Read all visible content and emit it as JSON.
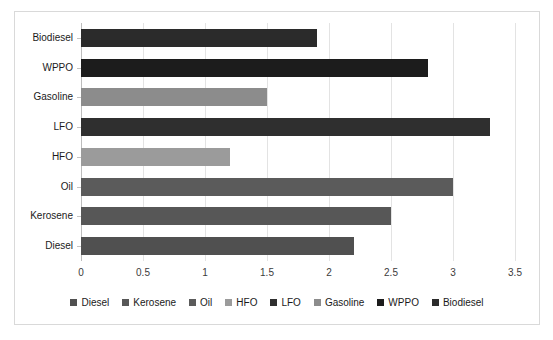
{
  "chart_data": {
    "type": "bar",
    "orientation": "horizontal",
    "title": "",
    "xlabel": "",
    "ylabel": "",
    "xlim": [
      0,
      3.5
    ],
    "xticks": [
      "0",
      "0.5",
      "1",
      "1.5",
      "2",
      "2.5",
      "3",
      "3.5"
    ],
    "xtick_values": [
      0,
      0.5,
      1,
      1.5,
      2,
      2.5,
      3,
      3.5
    ],
    "grid": true,
    "legend_position": "bottom",
    "categories": [
      "Biodiesel",
      "WPPO",
      "Gasoline",
      "LFO",
      "HFO",
      "Oil",
      "Kerosene",
      "Diesel"
    ],
    "values": [
      1.9,
      2.8,
      1.5,
      3.3,
      1.2,
      3.0,
      2.5,
      2.2
    ],
    "bars": [
      {
        "label": "Biodiesel",
        "value": 1.9,
        "color": "#2b2b2b"
      },
      {
        "label": "WPPO",
        "value": 2.8,
        "color": "#1c1c1c"
      },
      {
        "label": "Gasoline",
        "value": 1.5,
        "color": "#8c8c8c"
      },
      {
        "label": "LFO",
        "value": 3.3,
        "color": "#2f2f2f"
      },
      {
        "label": "HFO",
        "value": 1.2,
        "color": "#9b9b9b"
      },
      {
        "label": "Oil",
        "value": 3.0,
        "color": "#5b5b5b"
      },
      {
        "label": "Kerosene",
        "value": 2.5,
        "color": "#575757"
      },
      {
        "label": "Diesel",
        "value": 2.2,
        "color": "#505050"
      }
    ],
    "legend": [
      {
        "label": "Diesel",
        "color": "#505050"
      },
      {
        "label": "Kerosene",
        "color": "#575757"
      },
      {
        "label": "Oil",
        "color": "#5b5b5b"
      },
      {
        "label": "HFO",
        "color": "#9b9b9b"
      },
      {
        "label": "LFO",
        "color": "#2f2f2f"
      },
      {
        "label": "Gasoline",
        "color": "#8c8c8c"
      },
      {
        "label": "WPPO",
        "color": "#1c1c1c"
      },
      {
        "label": "Biodiesel",
        "color": "#2b2b2b"
      }
    ]
  },
  "style": {
    "border_color": "#d9d9d9",
    "gridline_color": "#e3e3e3",
    "axis_color": "#bdbdbd",
    "background": "#ffffff"
  }
}
